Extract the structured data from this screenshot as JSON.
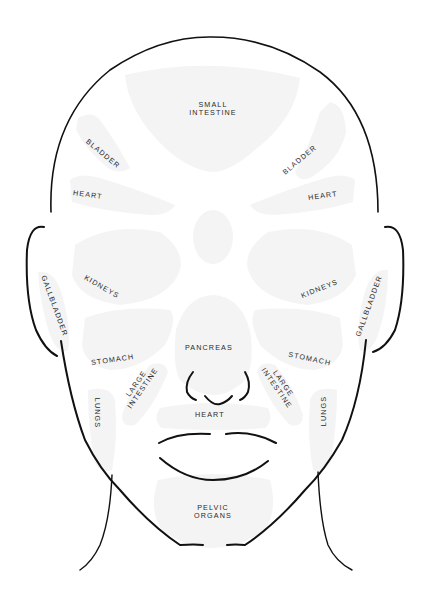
{
  "diagram": {
    "zone_color": "#f4f4f4",
    "line_color": "#111111",
    "text_color": "#2a2a2a",
    "labels": {
      "small_intestine": [
        "SMALL",
        "INTESTINE"
      ],
      "bladder_left": "BLADDER",
      "bladder_right": "BLADDER",
      "heart_left": "HEART",
      "heart_right": "HEART",
      "kidneys_left": "KIDNEYS",
      "kidneys_right": "KIDNEYS",
      "gallbladder_left": "GALLBLADDER",
      "gallbladder_right": "GALLBLADDER",
      "stomach_left": "STOMACH",
      "stomach_right": "STOMACH",
      "pancreas": "PANCREAS",
      "large_intestine_left": [
        "LARGE",
        "INTESTINE"
      ],
      "large_intestine_right": [
        "LARGE",
        "INTESTINE"
      ],
      "lungs_left": "LUNGS",
      "lungs_right": "LUNGS",
      "heart_center": "HEART",
      "pelvic_organs": [
        "PELVIC",
        "ORGANS"
      ]
    }
  }
}
